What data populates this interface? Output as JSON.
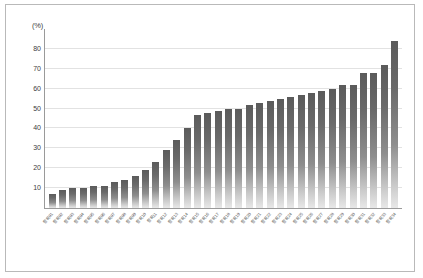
{
  "chart_data": {
    "type": "bar",
    "title": "",
    "xlabel": "",
    "ylabel": "",
    "unit_label": "(%)",
    "ylim": [
      0,
      90
    ],
    "grid": true,
    "legend": false,
    "yticks": [
      80,
      70,
      60,
      50,
      40,
      30,
      20,
      10
    ],
    "ytick_labels": [
      "80",
      "70",
      "60",
      "50",
      "40",
      "30",
      "20",
      "10"
    ],
    "orientation": "vertical",
    "sorted": "ascending",
    "bar_color": "#6a6a6a",
    "gridline_color": "#e2e2e2",
    "axis_color": "#9a9a9a",
    "border_color": "#b9b9b9",
    "categories": [
      "항목01",
      "항목02",
      "항목03",
      "항목04",
      "항목05",
      "항목06",
      "항목07",
      "항목08",
      "항목09",
      "항목10",
      "항목11",
      "항목12",
      "항목13",
      "항목14",
      "항목15",
      "항목16",
      "항목17",
      "항목18",
      "항목19",
      "항목20",
      "항목21",
      "항목22",
      "항목23",
      "항목24",
      "항목25",
      "항목26",
      "항목27",
      "항목28",
      "항목29",
      "항목30",
      "항목31",
      "항목32",
      "항목33",
      "항목34"
    ],
    "values": [
      7,
      9,
      10,
      10,
      11,
      11,
      13,
      14,
      16,
      19,
      23,
      29,
      34,
      40,
      47,
      48,
      49,
      50,
      50,
      52,
      53,
      54,
      55,
      56,
      57,
      58,
      59,
      60,
      62,
      62,
      68,
      68,
      72,
      84
    ]
  }
}
